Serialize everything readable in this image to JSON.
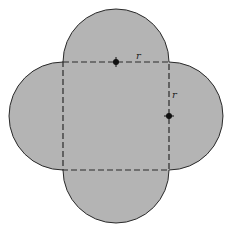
{
  "diagram": {
    "colors": {
      "fill": "#b4b4b4",
      "stroke": "#2a2a2a",
      "background": "#ffffff"
    },
    "square": {
      "x": 63,
      "y": 62,
      "side": 106
    },
    "radius": 53,
    "labels": {
      "top_radius": "r",
      "right_radius": "r"
    },
    "points": [
      {
        "name": "top-side-midpoint",
        "x": 116,
        "y": 62
      },
      {
        "name": "right-side-midpoint",
        "x": 169,
        "y": 116
      }
    ]
  }
}
